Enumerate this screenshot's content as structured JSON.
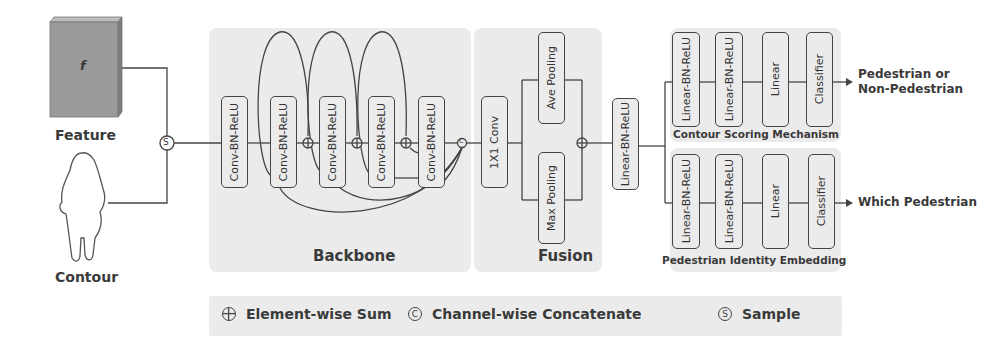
{
  "inputs": {
    "feature": {
      "label": "Feature",
      "symbol": "f"
    },
    "contour": {
      "label": "Contour"
    },
    "sample_op": "S"
  },
  "backbone": {
    "title": "Backbone",
    "blocks": [
      "Conv-BN-ReLU",
      "Conv-BN-ReLU",
      "Conv-BN-ReLU",
      "Conv-BN-ReLU",
      "Conv-BN-ReLU"
    ],
    "concat_op": "C"
  },
  "fusion": {
    "title": "Fusion",
    "conv": "1X1 Conv",
    "ave_pool": "Ave Pooling",
    "max_pool": "Max Pooling",
    "linear": "Linear-BN-ReLU"
  },
  "heads": {
    "scoring": {
      "title": "Contour Scoring Mechanism",
      "blocks": [
        "Linear-BN-ReLU",
        "Linear-BN-ReLU",
        "Linear",
        "Classifier"
      ],
      "output": [
        "Pedestrian or",
        "Non-Pedestrian"
      ]
    },
    "identity": {
      "title": "Pedestrian Identity Embedding",
      "blocks": [
        "Linear-BN-ReLU",
        "Linear-BN-ReLU",
        "Linear",
        "Classifier"
      ],
      "output": "Which Pedestrian"
    }
  },
  "legend": {
    "sum": {
      "symbol": "+",
      "label": "Element-wise Sum"
    },
    "concat": {
      "symbol": "C",
      "label": "Channel-wise Concatenate"
    },
    "sample": {
      "symbol": "S",
      "label": "Sample"
    }
  },
  "colors": {
    "panel": "#ebebeb",
    "line": "#444444",
    "feature_block": "#9a9a9a"
  }
}
